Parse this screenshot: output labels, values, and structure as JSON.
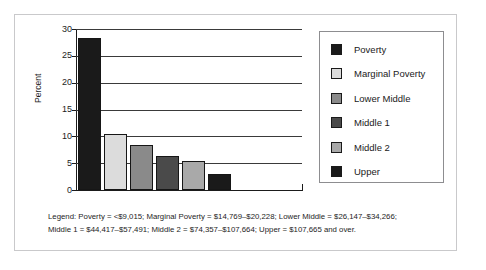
{
  "scan_artifact": "",
  "chart_data": {
    "type": "bar",
    "title": "",
    "xlabel": "",
    "ylabel": "Percent",
    "ylim": [
      0,
      30
    ],
    "yticks": [
      0,
      5,
      10,
      15,
      20,
      25,
      30
    ],
    "ytick_labels": [
      "0",
      "5",
      "10",
      "15",
      "20",
      "25",
      "30"
    ],
    "grid": true,
    "legend_position": "right",
    "categories": [
      "Poverty",
      "Marginal Poverty",
      "Lower Middle",
      "Middle 1",
      "Middle 2",
      "Upper"
    ],
    "values": [
      28.4,
      10.5,
      8.3,
      6.3,
      5.4,
      3.0
    ],
    "colors": [
      "#1a1a1a",
      "#dcdcdc",
      "#8a8a8a",
      "#4a4a4a",
      "#a9a9a9",
      "#1a1a1a"
    ],
    "series": [
      {
        "name": "Percent",
        "values": [
          28.4,
          10.5,
          8.3,
          6.3,
          5.4,
          3.0
        ]
      }
    ]
  },
  "legend": {
    "items": [
      {
        "label": "Poverty",
        "color": "#1a1a1a"
      },
      {
        "label": "Marginal Poverty",
        "color": "#dcdcdc"
      },
      {
        "label": "Lower Middle",
        "color": "#8a8a8a"
      },
      {
        "label": "Middle 1",
        "color": "#4a4a4a"
      },
      {
        "label": "Middle 2",
        "color": "#a9a9a9"
      },
      {
        "label": "Upper",
        "color": "#1a1a1a"
      }
    ]
  },
  "caption": {
    "line1": "Legend: Poverty = <$9,015; Marginal Poverty = $14,769–$20,228; Lower Middle = $26,147–$34,266;",
    "line2": "Middle 1 = $44,417–$57,491; Middle 2 = $74,357–$107,664; Upper = $107,665 and over."
  }
}
